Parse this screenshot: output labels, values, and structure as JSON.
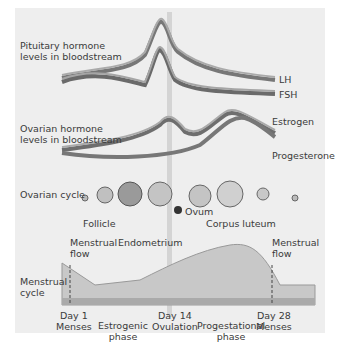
{
  "pituitary": {
    "label_line1": "Pituitary hormone",
    "label_line2": "levels in bloodstream",
    "lh": "LH",
    "fsh": "FSH"
  },
  "ovarian_hormone": {
    "label_line1": "Ovarian hormone",
    "label_line2": "levels in bloodstream",
    "estrogen": "Estrogen",
    "progesterone": "Progesterone"
  },
  "ovarian_cycle": {
    "label": "Ovarian cycle",
    "follicle": "Follicle",
    "ovum": "Ovum",
    "corpus_luteum": "Corpus luteum"
  },
  "menstrual": {
    "label_line1": "Menstrual",
    "label_line2": "cycle",
    "flow1_line1": "Menstrual",
    "flow1_line2": "flow",
    "endometrium": "Endometrium",
    "flow2_line1": "Menstrual",
    "flow2_line2": "flow"
  },
  "timeline": {
    "day1": "Day 1",
    "menses1": "Menses",
    "estrogenic1": "Estrogenic",
    "estrogenic2": "phase",
    "day14": "Day 14",
    "ovulation": "Ovulation",
    "progestational1": "Progestational",
    "progestational2": "phase",
    "day28": "Day 28",
    "menses2": "Menses"
  },
  "colors": {
    "ribbon_dark": "#6e6e6e",
    "ribbon_light": "#a8a8a8",
    "panel": "#eeeeee",
    "endometrium": "#c8c8c8"
  }
}
